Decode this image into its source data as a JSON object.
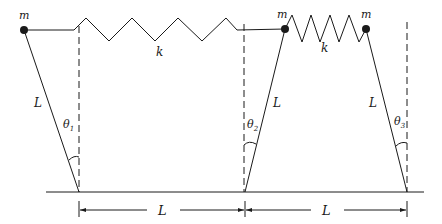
{
  "diagram": {
    "type": "coupled-pendulums-with-springs",
    "masses": [
      {
        "id": "mass-1",
        "label": "m"
      },
      {
        "id": "mass-2",
        "label": "m"
      },
      {
        "id": "mass-3",
        "label": "m"
      }
    ],
    "springs": [
      {
        "id": "spring-1",
        "label": "k"
      },
      {
        "id": "spring-2",
        "label": "k"
      }
    ],
    "rods": [
      {
        "id": "rod-1",
        "label": "L"
      },
      {
        "id": "rod-2",
        "label": "L"
      },
      {
        "id": "rod-3",
        "label": "L"
      }
    ],
    "angles": [
      {
        "id": "theta-1",
        "label": "θ",
        "sub": "1"
      },
      {
        "id": "theta-2",
        "label": "θ",
        "sub": "2"
      },
      {
        "id": "theta-3",
        "label": "θ",
        "sub": "3"
      }
    ],
    "dimensions": [
      {
        "id": "spacing-1",
        "label": "L"
      },
      {
        "id": "spacing-2",
        "label": "L"
      }
    ],
    "colors": {
      "ink": "#1a1a1a",
      "background": "#ffffff"
    }
  }
}
